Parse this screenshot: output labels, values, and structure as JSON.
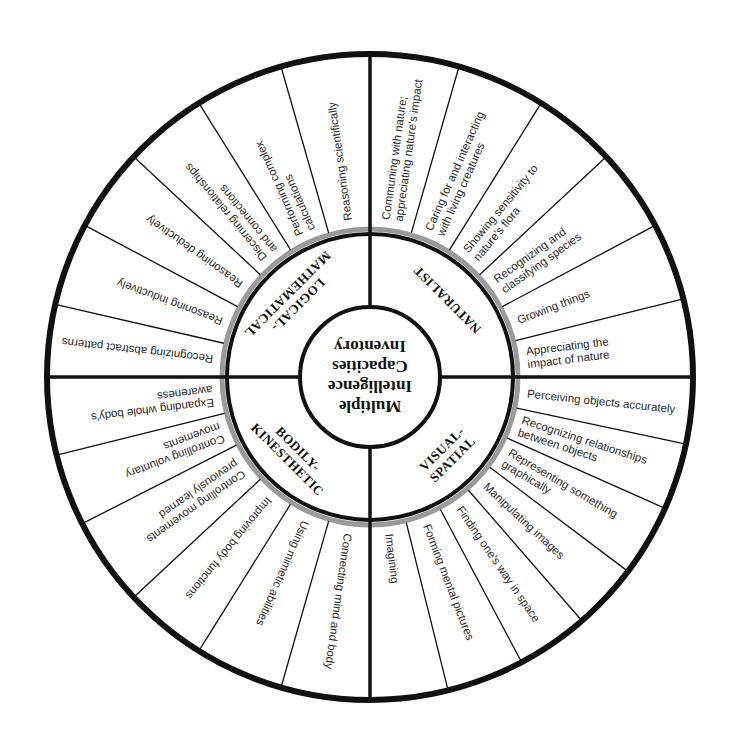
{
  "title": {
    "lines": [
      "Multiple",
      "Intelligence",
      "Capacities",
      "Inventory"
    ]
  },
  "geometry": {
    "center": [
      370,
      377
    ],
    "outer_radius": 323,
    "gray_ring_radius": 148,
    "black_ring_radius": 143,
    "inner_radius": 70
  },
  "colors": {
    "line": "#111111",
    "gray_ring": "#9a9a9a",
    "text": "#2a2a2a",
    "background": "#ffffff"
  },
  "categories": [
    {
      "name": "LOGICAL-MATHEMATICAL",
      "label_lines": [
        "LOGICAL-",
        "MATHEMATICAL"
      ],
      "start_angle": 180,
      "end_angle": 270,
      "spokes": [
        193,
        208,
        223,
        238,
        254
      ],
      "items": [
        {
          "lines": [
            "Recognizing abstract patterns"
          ]
        },
        {
          "lines": [
            "Reasoning inductively"
          ]
        },
        {
          "lines": [
            "Reasoning deductively"
          ]
        },
        {
          "lines": [
            "Discerning relationships",
            "and connections"
          ]
        },
        {
          "lines": [
            "Performing complex",
            "calculations"
          ]
        },
        {
          "lines": [
            "Reasoning scientifically"
          ]
        }
      ]
    },
    {
      "name": "NATURALIST",
      "label_lines": [
        "NATURALIST"
      ],
      "start_angle": 270,
      "end_angle": 360,
      "spokes": [
        286,
        302,
        317,
        332,
        346
      ],
      "items": [
        {
          "lines": [
            "Communing with nature;",
            "appreciating nature's impact"
          ]
        },
        {
          "lines": [
            "Caring for and interacting",
            "with living creatures"
          ]
        },
        {
          "lines": [
            "Showing sensitivity to",
            "nature's flora"
          ]
        },
        {
          "lines": [
            "Recognizing and",
            "classifying species"
          ]
        },
        {
          "lines": [
            "Growing things"
          ]
        },
        {
          "lines": [
            "Appreciating the",
            "impact of nature"
          ]
        }
      ]
    },
    {
      "name": "VISUAL-SPATIAL",
      "label_lines": [
        "VISUAL-",
        "SPATIAL"
      ],
      "start_angle": 0,
      "end_angle": 90,
      "spokes": [
        12,
        24,
        37,
        49,
        62,
        76
      ],
      "items": [
        {
          "lines": [
            "Perceiving objects accurately"
          ]
        },
        {
          "lines": [
            "Recognizing relationships",
            "between objects"
          ]
        },
        {
          "lines": [
            "Representing something",
            "graphically"
          ]
        },
        {
          "lines": [
            "Manipulating images"
          ]
        },
        {
          "lines": [
            "Finding one's way in space"
          ]
        },
        {
          "lines": [
            "Forming mental pictures"
          ]
        },
        {
          "lines": [
            "Imagining"
          ]
        }
      ]
    },
    {
      "name": "BODILY-KINESTHETIC",
      "label_lines": [
        "BODILY-",
        "KINESTHETIC"
      ],
      "start_angle": 90,
      "end_angle": 180,
      "spokes": [
        106,
        122,
        137,
        153,
        166
      ],
      "items": [
        {
          "lines": [
            "Connecting mind and body"
          ]
        },
        {
          "lines": [
            "Using mimetic abilities"
          ]
        },
        {
          "lines": [
            "Improving body functions"
          ]
        },
        {
          "lines": [
            "Controlling movements",
            "previously learned"
          ]
        },
        {
          "lines": [
            "Controlling voluntary",
            "movements"
          ]
        },
        {
          "lines": [
            "Expanding whole body's",
            "awareness"
          ]
        }
      ]
    }
  ]
}
